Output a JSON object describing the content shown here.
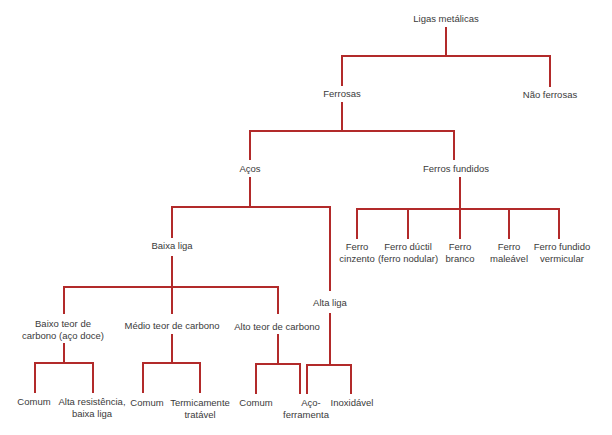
{
  "diagram": {
    "type": "tree",
    "line_color": "#b22a2a",
    "root": "Ligas metálicas",
    "nodes": {
      "ligas_metalicas": "Ligas metálicas",
      "ferrosas": "Ferrosas",
      "nao_ferrosas": "Não ferrosas",
      "acos": "Aços",
      "ferros_fundidos": "Ferros fundidos",
      "baixa_liga": "Baixa liga",
      "alta_liga": "Alta liga",
      "baixo_teor_1": "Baixo teor de",
      "baixo_teor_2": "carbono (aço doce)",
      "medio_teor": "Médio teor de carbono",
      "alto_teor": "Alto teor de carbono",
      "ferro_cinzento_1": "Ferro",
      "ferro_cinzento_2": "cinzento",
      "ferro_ductil_1": "Ferro dúctil",
      "ferro_ductil_2": "(ferro nodular)",
      "ferro_branco_1": "Ferro",
      "ferro_branco_2": "branco",
      "ferro_maleavel_1": "Ferro",
      "ferro_maleavel_2": "maleável",
      "ferro_vermicular_1": "Ferro fundido",
      "ferro_vermicular_2": "vermicular",
      "baixo_comum": "Comum",
      "alta_resistencia_1": "Alta resistência,",
      "alta_resistencia_2": "baixa liga",
      "medio_comum": "Comum",
      "termicamente_1": "Termicamente",
      "termicamente_2": "tratável",
      "alto_comum": "Comum",
      "aco_ferramenta_1": "Aço-",
      "aco_ferramenta_2": "ferramenta",
      "inoxidavel": "Inoxidável"
    }
  }
}
